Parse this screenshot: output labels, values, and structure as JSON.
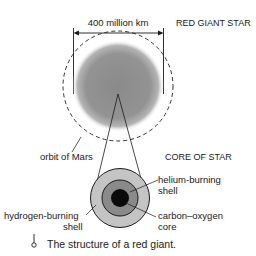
{
  "diagram": {
    "title": "RED GIANT STAR",
    "dimension_label": "400 million km",
    "orbit_label": "orbit of Mars",
    "core_title": "CORE OF STAR",
    "layers": [
      {
        "line1": "helium-burning",
        "line2": "shell",
        "color": "#8a8a8a"
      },
      {
        "line1": "carbon–oxygen",
        "line2": "core",
        "color": "#0a0a0a"
      },
      {
        "line1": "hydrogen-burning",
        "line2": "shell",
        "color": "#c4c4c4"
      }
    ],
    "star_color": "#8c8c8c"
  },
  "caption": {
    "icon": "pin-icon",
    "text": "The structure of a red giant."
  }
}
